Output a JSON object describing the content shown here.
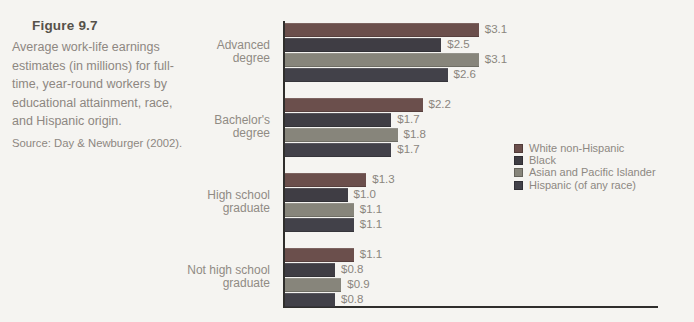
{
  "caption": {
    "title": "Figure 9.7",
    "description": "Average work-life earnings estimates (in millions) for full-time, year-round workers by educational attainment, race, and Hispanic origin.",
    "source": "Source: Day & Newburger (2002)."
  },
  "legend": {
    "entries": [
      {
        "label": "White non-Hispanic",
        "color": "#6b4f4c"
      },
      {
        "label": "Black",
        "color": "#3f3d44"
      },
      {
        "label": "Asian and Pacific Islander",
        "color": "#87857b"
      },
      {
        "label": "Hispanic (of any race)",
        "color": "#424149"
      }
    ]
  },
  "chart_data": {
    "type": "bar",
    "orientation": "horizontal",
    "categories": [
      "Advanced degree",
      "Bachelor's degree",
      "High school graduate",
      "Not high school graduate"
    ],
    "series": [
      {
        "name": "White non-Hispanic",
        "color": "#6b4f4c",
        "values": [
          3.1,
          2.2,
          1.3,
          1.1
        ]
      },
      {
        "name": "Black",
        "color": "#3f3d44",
        "values": [
          2.5,
          1.7,
          1.0,
          0.8
        ]
      },
      {
        "name": "Asian and Pacific Islander",
        "color": "#87857b",
        "values": [
          3.1,
          1.8,
          1.1,
          0.9
        ]
      },
      {
        "name": "Hispanic (of any race)",
        "color": "#424149",
        "values": [
          2.6,
          1.7,
          1.1,
          0.8
        ]
      }
    ],
    "bar_labels": [
      [
        "$3.1",
        "$2.5",
        "$3.1",
        "$2.6"
      ],
      [
        "$2.2",
        "$1.7",
        "$1.8",
        "$1.7"
      ],
      [
        "$1.3",
        "$1.0",
        "$1.1",
        "$1.1"
      ],
      [
        "$1.1",
        "$0.8",
        "$0.9",
        "$0.8"
      ]
    ],
    "xlim": [
      0,
      6
    ],
    "grid": false,
    "legend_position": "right",
    "value_prefix": "$"
  },
  "colors": {
    "background": "#f5f4f1",
    "axis": "#2f2e2c",
    "muted_text": "#8d8781",
    "title_text": "#56514a"
  }
}
